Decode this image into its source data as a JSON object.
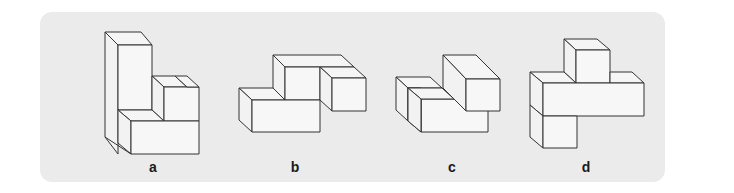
{
  "figure": {
    "background_color": "#ebebeb",
    "stroke_color": "#333333",
    "face_color": "#f7f7f7"
  },
  "options": [
    {
      "id": "a",
      "label": "a"
    },
    {
      "id": "b",
      "label": "b"
    },
    {
      "id": "c",
      "label": "c"
    },
    {
      "id": "d",
      "label": "d"
    }
  ]
}
